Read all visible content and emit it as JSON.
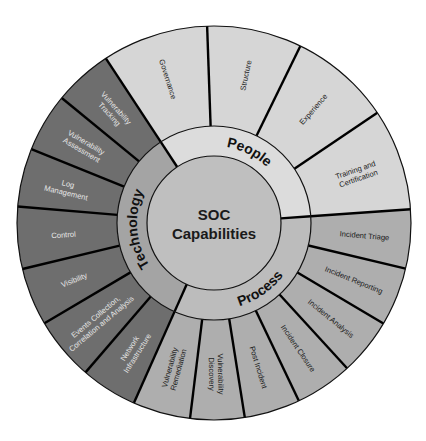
{
  "diagram": {
    "title_line1": "SOC",
    "title_line2": "Capabilities",
    "geometry": {
      "cx": 214,
      "cy": 223,
      "r_outer": 197,
      "r_mid": 97,
      "r_inner": 67
    },
    "colors": {
      "background": "#ffffff",
      "center": "#bfbfbf",
      "outline": "#111111"
    },
    "categories": [
      {
        "name": "People",
        "start": 236.7,
        "end": 356,
        "outer_fill": "#d6d6d6",
        "mid_fill": "#dcdcdc",
        "text_color": "#222222",
        "label_flip": false,
        "segments": [
          {
            "label": [
              "Governance"
            ],
            "start": 236.7,
            "end": 268
          },
          {
            "label": [
              "Structure"
            ],
            "start": 268,
            "end": 296
          },
          {
            "label": [
              "Experience"
            ],
            "start": 296,
            "end": 326
          },
          {
            "label": [
              "Training and",
              "Certification"
            ],
            "start": 326,
            "end": 356
          }
        ]
      },
      {
        "name": "Process",
        "start": 356,
        "end": 474,
        "outer_fill": "#aeaeae",
        "mid_fill": "#bcbcbc",
        "text_color": "#1a1a1a",
        "label_flip": true,
        "segments": [
          {
            "label": [
              "Incident Triage"
            ],
            "start": 356,
            "end": 373.4
          },
          {
            "label": [
              "Incident Reporting"
            ],
            "start": 373.4,
            "end": 390.7
          },
          {
            "label": [
              "Incident Analysis"
            ],
            "start": 390.7,
            "end": 407.5
          },
          {
            "label": [
              "Incident Closure"
            ],
            "start": 407.5,
            "end": 424.5
          },
          {
            "label": [
              "Post Incident"
            ],
            "start": 424.5,
            "end": 441
          },
          {
            "label": [
              "Vulnerability",
              "Discovery"
            ],
            "start": 441,
            "end": 457
          },
          {
            "label": [
              "Vulnerability",
              "Remediation"
            ],
            "start": 457,
            "end": 474
          }
        ]
      },
      {
        "name": "Technology",
        "start": 114,
        "end": 236.7,
        "outer_fill": "#6e6e6e",
        "mid_fill": "#a4a4a4",
        "text_color": "#e6e6e6",
        "label_flip": false,
        "segments": [
          {
            "label": [
              "Network",
              "Infrastructure"
            ],
            "start": 114,
            "end": 130.7
          },
          {
            "label": [
              "Events Collection,",
              "Correlation and Analysis"
            ],
            "start": 130.7,
            "end": 149.4
          },
          {
            "label": [
              "Visibility"
            ],
            "start": 149.4,
            "end": 166.5
          },
          {
            "label": [
              "Control"
            ],
            "start": 166.5,
            "end": 184.8
          },
          {
            "label": [
              "Log",
              "Management"
            ],
            "start": 184.8,
            "end": 202
          },
          {
            "label": [
              "Vulnerability",
              "Assessment"
            ],
            "start": 202,
            "end": 219.4
          },
          {
            "label": [
              "Vulnerability",
              "Tracking"
            ],
            "start": 219.4,
            "end": 236.7
          }
        ]
      }
    ]
  }
}
